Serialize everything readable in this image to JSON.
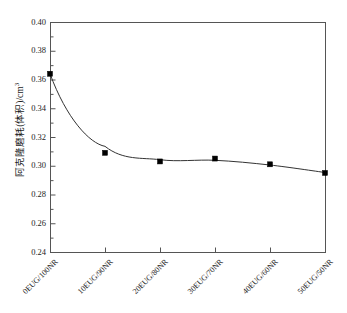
{
  "chart_data": {
    "type": "line",
    "title": "",
    "subtitle": "",
    "xlabel": "",
    "ylabel": "阿克隆磨耗(体积)/cm",
    "ylabel_unit_sup": "3",
    "categories": [
      "0EUG/100NR",
      "10EUG/90NR",
      "20EUG/80NR",
      "30EUG/70NR",
      "40EUG/60NR",
      "50EUG/50NR"
    ],
    "series": [
      {
        "name": "阿克隆磨耗(体积)",
        "values": [
          0.364,
          0.309,
          0.303,
          0.305,
          0.301,
          0.295
        ],
        "marker": "filled-square",
        "marker_color": "#000000",
        "line_color": "#333333",
        "line_style": "smooth-fit-curve"
      }
    ],
    "ylim": [
      0.24,
      0.4
    ],
    "ytick_labels": [
      "0.40",
      "0.38",
      "0.36",
      "0.34",
      "0.32",
      "0.30",
      "0.28",
      "0.26",
      "0.24"
    ],
    "ytick_values": [
      0.4,
      0.38,
      0.36,
      0.34,
      0.32,
      0.3,
      0.28,
      0.26,
      0.24
    ],
    "ytick_minor_count_between": 1,
    "xtick_label_rotation_deg": -45,
    "grid": false,
    "legend": false,
    "legend_position": "none",
    "frame": "box",
    "background_color": "#ffffff",
    "axis_color": "#555555"
  },
  "axes": {
    "plot_left_px": 50,
    "plot_right_px": 325,
    "plot_top_px": 22,
    "plot_bottom_px": 252
  }
}
